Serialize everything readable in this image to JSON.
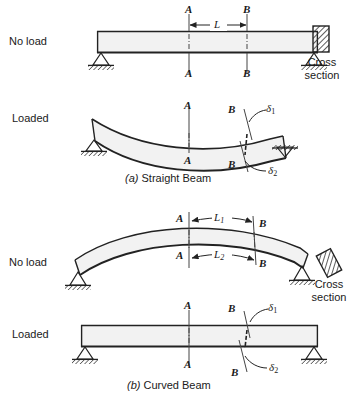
{
  "figure": {
    "captions": [
      {
        "tag": "(a)",
        "text": "Straight Beam"
      },
      {
        "tag": "(b)",
        "text": "Curved Beam"
      }
    ]
  },
  "colors": {
    "ink": "#1a1a1a",
    "line": "#222222",
    "beam_fill": "#f2f2f2",
    "hatch": "#333333",
    "background": "#ffffff"
  },
  "panels": [
    {
      "id": "straight-no-load",
      "state_label": "No load",
      "section_labels_top": [
        "A",
        "B"
      ],
      "section_labels_bottom": [
        "A",
        "B"
      ],
      "dimensions": [
        {
          "name": "L",
          "base": "L",
          "sub": "",
          "position": "top"
        }
      ]
    },
    {
      "id": "straight-loaded",
      "state_label": "Loaded",
      "section_labels_top": [
        "A",
        "B"
      ],
      "section_labels_bottom": [
        "A",
        "B"
      ],
      "deflections": [
        {
          "base": "δ",
          "sub": "1"
        },
        {
          "base": "δ",
          "sub": "2"
        }
      ]
    },
    {
      "id": "curved-no-load",
      "state_label": "No load",
      "section_labels_top": [
        "A",
        "B"
      ],
      "section_labels_bottom": [
        "A",
        "B"
      ],
      "dimensions": [
        {
          "name": "L1",
          "base": "L",
          "sub": "1",
          "position": "upper"
        },
        {
          "name": "L2",
          "base": "L",
          "sub": "2",
          "position": "lower"
        }
      ]
    },
    {
      "id": "curved-loaded",
      "state_label": "Loaded",
      "section_labels_top": [
        "A",
        "B"
      ],
      "section_labels_bottom": [
        "A",
        "B"
      ],
      "deflections": [
        {
          "base": "δ",
          "sub": "1"
        },
        {
          "base": "δ",
          "sub": "2"
        }
      ]
    }
  ],
  "cross_sections": [
    {
      "id": "xsec-straight",
      "line1": "Cross",
      "line2": "section",
      "orientation": "upright"
    },
    {
      "id": "xsec-curved",
      "line1": "Cross",
      "line2": "section",
      "orientation": "tilted"
    }
  ],
  "labels": {
    "A": "A",
    "B": "B",
    "L": "L",
    "sub1": "1",
    "sub2": "2",
    "delta": "δ",
    "no_load": "No load",
    "loaded": "Loaded",
    "cross": "Cross",
    "section": "section",
    "cap_a_tag": "(a)",
    "cap_a_text": "Straight Beam",
    "cap_b_tag": "(b)",
    "cap_b_text": "Curved Beam"
  }
}
